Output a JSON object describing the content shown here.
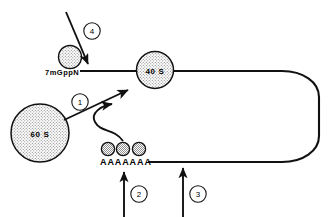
{
  "figure": {
    "background_color": "#ffffff",
    "line_color": "#111111"
  },
  "labels": {
    "cap_structure": "7mGppN",
    "small_subunit": "40 S",
    "large_subunit": "60 S",
    "poly_a_tail": "AAAAAAA"
  },
  "steps": [
    {
      "id": "1",
      "label": "1"
    },
    {
      "id": "2",
      "label": "2"
    },
    {
      "id": "3",
      "label": "3"
    },
    {
      "id": "4",
      "label": "4"
    }
  ],
  "elements": {
    "cap_circle_name": "cap-binding-protein-circle",
    "poly_a_proteins_count": 3,
    "mrna_loop_name": "mrna-circular-loop"
  }
}
